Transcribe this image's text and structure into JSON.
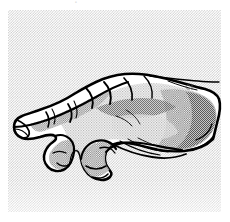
{
  "figure": {
    "name": "hand-illustration",
    "style": "black-and-white pen-and-ink line drawing with halftone shading",
    "background_pattern": "fine checkerboard halftone dots",
    "panel": {
      "x": 8,
      "y": 10,
      "width": 213,
      "height": 202,
      "fill_color": "#ffffff",
      "dot_color": "#c9c9c9"
    },
    "canvas": {
      "width": 230,
      "height": 222,
      "background_color": "#ffffff"
    },
    "ink_color": "#000000",
    "shadow_color": "#8c8c8c",
    "midtone_color": "#b4b4b4",
    "highlight_color": "#ffffff"
  },
  "marks": {
    "top_artifact": "▫",
    "right_squiggle": "ca"
  },
  "parts": [
    {
      "name": "index-finger",
      "label": "Index finger, extended toward lower left"
    },
    {
      "name": "middle-finger",
      "label": "Middle finger, partly curled"
    },
    {
      "name": "ring-finger",
      "label": "Ring finger, curled"
    },
    {
      "name": "little-finger",
      "label": "Little finger, curled"
    },
    {
      "name": "thumb",
      "label": "Thumb tucked beneath the palm"
    },
    {
      "name": "knuckles",
      "label": "Row of knuckles along the top edge"
    },
    {
      "name": "wrist",
      "label": "Wrist and forearm stub at right"
    }
  ]
}
